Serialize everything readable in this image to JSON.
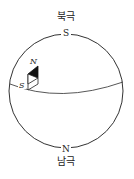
{
  "diagram": {
    "north_pole_label": "북극",
    "south_pole_label": "남극",
    "globe_top_marker": "S",
    "globe_bottom_marker": "N",
    "compass": {
      "north_label": "N",
      "south_label": "S"
    },
    "colors": {
      "line": "#333333",
      "needle_north": "#111111",
      "needle_south": "#ffffff",
      "background": "#ffffff"
    }
  }
}
